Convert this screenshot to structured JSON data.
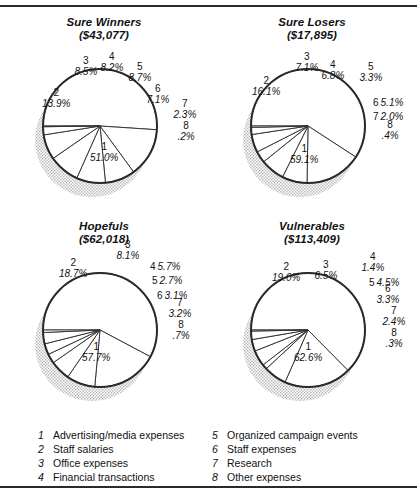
{
  "figure": {
    "background": "#ffffff",
    "line_color": "#2a2a2a",
    "shadow_color": "#b5b5b5"
  },
  "legend": {
    "columns": [
      {
        "items": [
          {
            "num": "1",
            "label": "Advertising/media expenses"
          },
          {
            "num": "2",
            "label": "Staff salaries"
          },
          {
            "num": "3",
            "label": "Office expenses"
          },
          {
            "num": "4",
            "label": "Financial transactions"
          }
        ]
      },
      {
        "items": [
          {
            "num": "5",
            "label": "Organized campaign events"
          },
          {
            "num": "6",
            "label": "Staff expenses"
          },
          {
            "num": "7",
            "label": "Research"
          },
          {
            "num": "8",
            "label": "Other expenses"
          }
        ]
      }
    ]
  },
  "chart_data": [
    {
      "type": "pie",
      "title": "Sure Winners",
      "subtitle": "($43,077)",
      "total": 43077,
      "categories": [
        "Advertising/media expenses",
        "Staff salaries",
        "Office expenses",
        "Financial transactions",
        "Organized campaign events",
        "Staff expenses",
        "Research",
        "Other expenses"
      ],
      "slice_numbers": [
        "1",
        "2",
        "3",
        "4",
        "5",
        "6",
        "7",
        "8"
      ],
      "values": [
        51.0,
        13.9,
        8.5,
        8.2,
        8.7,
        7.1,
        2.3,
        0.2
      ],
      "value_labels": [
        "51.0%",
        "13.9%",
        "8.5%",
        "8.2%",
        "8.7%",
        "7.1%",
        "2.3%",
        ".2%"
      ],
      "ylabel": "",
      "xlabel": "",
      "legend_position": "bottom"
    },
    {
      "type": "pie",
      "title": "Sure Losers",
      "subtitle": "($17,895)",
      "total": 17895,
      "categories": [
        "Advertising/media expenses",
        "Staff salaries",
        "Office expenses",
        "Financial transactions",
        "Organized campaign events",
        "Staff expenses",
        "Research",
        "Other expenses"
      ],
      "slice_numbers": [
        "1",
        "2",
        "3",
        "4",
        "5",
        "6",
        "7",
        "8"
      ],
      "values": [
        59.1,
        16.1,
        7.1,
        6.8,
        3.3,
        5.1,
        2.0,
        0.4
      ],
      "value_labels": [
        "59.1%",
        "16.1%",
        "7.1%",
        "6.8%",
        "3.3%",
        "5.1%",
        "2.0%",
        ".4%"
      ],
      "ylabel": "",
      "xlabel": "",
      "legend_position": "bottom"
    },
    {
      "type": "pie",
      "title": "Hopefuls",
      "subtitle": "($62,018)",
      "total": 62018,
      "categories": [
        "Advertising/media expenses",
        "Staff salaries",
        "Office expenses",
        "Financial transactions",
        "Organized campaign events",
        "Staff expenses",
        "Research",
        "Other expenses"
      ],
      "slice_numbers": [
        "1",
        "2",
        "3",
        "4",
        "5",
        "6",
        "7",
        "8"
      ],
      "values": [
        57.7,
        18.7,
        8.1,
        5.7,
        2.7,
        3.1,
        3.2,
        0.7
      ],
      "value_labels": [
        "57.7%",
        "18.7%",
        "8.1%",
        "5.7%",
        "2.7%",
        "3.1%",
        "3.2%",
        ".7%"
      ],
      "ylabel": "",
      "xlabel": "",
      "legend_position": "bottom"
    },
    {
      "type": "pie",
      "title": "Vulnerables",
      "subtitle": "($113,409)",
      "total": 113409,
      "categories": [
        "Advertising/media expenses",
        "Staff salaries",
        "Office expenses",
        "Financial transactions",
        "Organized campaign events",
        "Staff expenses",
        "Research",
        "Other expenses"
      ],
      "slice_numbers": [
        "1",
        "2",
        "3",
        "4",
        "5",
        "6",
        "7",
        "8"
      ],
      "values": [
        62.6,
        19.0,
        6.5,
        1.4,
        4.5,
        3.3,
        2.4,
        0.3
      ],
      "value_labels": [
        "62.6%",
        "19.0%",
        "6.5%",
        "1.4%",
        "4.5%",
        "3.3%",
        "2.4%",
        ".3%"
      ],
      "ylabel": "",
      "xlabel": "",
      "legend_position": "bottom"
    }
  ],
  "label_layout": [
    [
      {
        "x": 104,
        "y": 138,
        "mode": "stack",
        "align": "center"
      },
      {
        "x": 56,
        "y": 84,
        "mode": "stack",
        "align": "center"
      },
      {
        "x": 86,
        "y": 52,
        "mode": "stack",
        "align": "center"
      },
      {
        "x": 112,
        "y": 48,
        "mode": "stack",
        "align": "center"
      },
      {
        "x": 140,
        "y": 58,
        "mode": "stack",
        "align": "center"
      },
      {
        "x": 158,
        "y": 80,
        "mode": "stack",
        "align": "center"
      },
      {
        "x": 185,
        "y": 95,
        "mode": "stack",
        "align": "center"
      },
      {
        "x": 186,
        "y": 117,
        "mode": "stack",
        "align": "center"
      }
    ],
    [
      {
        "x": 96,
        "y": 140,
        "mode": "stack",
        "align": "center"
      },
      {
        "x": 58,
        "y": 72,
        "mode": "stack",
        "align": "center"
      },
      {
        "x": 99,
        "y": 48,
        "mode": "stack",
        "align": "center"
      },
      {
        "x": 125,
        "y": 56,
        "mode": "stack",
        "align": "center"
      },
      {
        "x": 163,
        "y": 58,
        "mode": "stack",
        "align": "center"
      },
      {
        "x": 180,
        "y": 88,
        "mode": "inline",
        "align": "center"
      },
      {
        "x": 180,
        "y": 102,
        "mode": "inline",
        "align": "center"
      },
      {
        "x": 182,
        "y": 116,
        "mode": "stack",
        "align": "center"
      }
    ],
    [
      {
        "x": 96,
        "y": 134,
        "mode": "stack",
        "align": "center"
      },
      {
        "x": 73,
        "y": 50,
        "mode": "stack",
        "align": "center"
      },
      {
        "x": 128,
        "y": 32,
        "mode": "stack",
        "align": "center"
      },
      {
        "x": 165,
        "y": 48,
        "mode": "inline",
        "align": "center"
      },
      {
        "x": 167,
        "y": 62,
        "mode": "inline",
        "align": "center"
      },
      {
        "x": 172,
        "y": 77,
        "mode": "inline",
        "align": "center"
      },
      {
        "x": 180,
        "y": 90,
        "mode": "stack",
        "align": "center"
      },
      {
        "x": 181,
        "y": 112,
        "mode": "stack",
        "align": "center"
      }
    ],
    [
      {
        "x": 100,
        "y": 134,
        "mode": "stack",
        "align": "center"
      },
      {
        "x": 78,
        "y": 54,
        "mode": "stack",
        "align": "center"
      },
      {
        "x": 118,
        "y": 52,
        "mode": "stack",
        "align": "center"
      },
      {
        "x": 165,
        "y": 44,
        "mode": "stack",
        "align": "center"
      },
      {
        "x": 176,
        "y": 64,
        "mode": "inline",
        "align": "center"
      },
      {
        "x": 180,
        "y": 76,
        "mode": "stack",
        "align": "center"
      },
      {
        "x": 186,
        "y": 98,
        "mode": "stack",
        "align": "center"
      },
      {
        "x": 186,
        "y": 120,
        "mode": "stack",
        "align": "center"
      }
    ]
  ],
  "pie_geometry": {
    "cx": 100,
    "cy": 112,
    "r": 57,
    "start_angle_deg": 180,
    "direction": "counterclockwise",
    "shadow_dx": -8,
    "shadow_dy": 14
  }
}
